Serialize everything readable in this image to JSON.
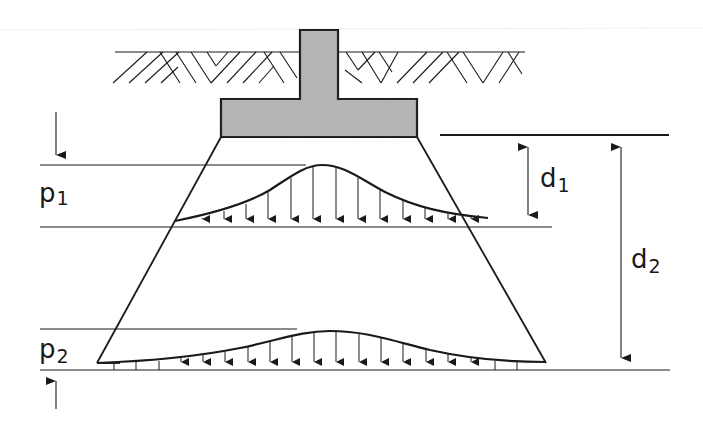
{
  "diagram": {
    "labels": {
      "p1": "p",
      "p1_sub": "1",
      "p2": "p",
      "p2_sub": "2",
      "d1": "d",
      "d1_sub": "1",
      "d2": "d",
      "d2_sub": "2"
    },
    "colors": {
      "line": "#1a1a1a",
      "footing_fill": "#b4b4b4",
      "background": "#ffffff"
    },
    "elements": [
      "ground-surface-with-soil-hatching",
      "column",
      "footing",
      "load-spread-trapezoid",
      "pressure-distribution-p1 at depth d1",
      "pressure-distribution-p2 at depth d2",
      "dimension-d1",
      "dimension-d2"
    ]
  }
}
